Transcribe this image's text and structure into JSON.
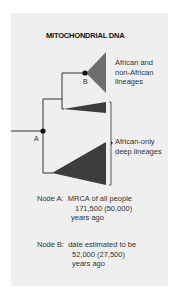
{
  "title": "MITOCHONDRIAL DNA",
  "nodes": {
    "a": {
      "letter": "A"
    },
    "b": {
      "letter": "B"
    }
  },
  "clade_labels": {
    "african_non_african": [
      "African and",
      "non-African",
      "lineages"
    ],
    "african_only": [
      "African-only",
      "deep lineages"
    ]
  },
  "notes": {
    "node_a": {
      "prefix": "Node A:",
      "lines": [
        "MRCA of all people",
        "171,500 (50,000)",
        "years ago"
      ]
    },
    "node_b": {
      "prefix": "Node B:",
      "lines": [
        "date estimated to be",
        "52,000 (27,500)",
        "years ago"
      ]
    }
  },
  "colors": {
    "panel_bg": "#efefef",
    "branch": "#333333",
    "clade_b_fill": "#6e6e6e",
    "clade_deep_fill": "#3d3d3d"
  }
}
